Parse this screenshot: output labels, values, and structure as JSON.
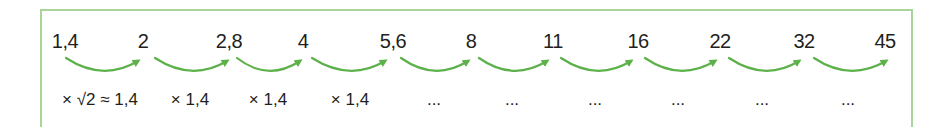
{
  "diagram": {
    "title": "",
    "arrow_color": "#5cb14a",
    "frame_color": "#a8d59a",
    "numbers": [
      {
        "label": "1,4",
        "x": 65
      },
      {
        "label": "2",
        "x": 143
      },
      {
        "label": "2,8",
        "x": 229
      },
      {
        "label": "4",
        "x": 303
      },
      {
        "label": "5,6",
        "x": 393
      },
      {
        "label": "8",
        "x": 471
      },
      {
        "label": "11",
        "x": 553
      },
      {
        "label": "16",
        "x": 638
      },
      {
        "label": "22",
        "x": 720
      },
      {
        "label": "32",
        "x": 804
      },
      {
        "label": "45",
        "x": 885
      }
    ],
    "multipliers": [
      {
        "label": "× √2 ≈ 1,4",
        "x": 100
      },
      {
        "label": "× 1,4",
        "x": 190
      },
      {
        "label": "× 1,4",
        "x": 268
      },
      {
        "label": "× 1,4",
        "x": 350
      },
      {
        "label": "...",
        "x": 434
      },
      {
        "label": "...",
        "x": 512
      },
      {
        "label": "...",
        "x": 595
      },
      {
        "label": "...",
        "x": 678
      },
      {
        "label": "...",
        "x": 762
      },
      {
        "label": "...",
        "x": 848
      }
    ]
  }
}
